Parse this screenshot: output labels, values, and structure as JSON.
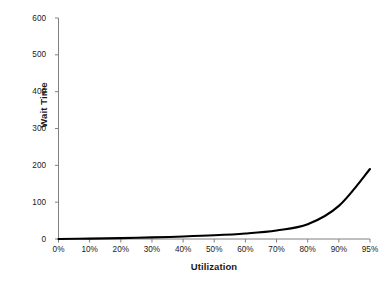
{
  "chart_data": {
    "type": "line",
    "title": "",
    "xlabel": "Utilization",
    "ylabel": "Wait Time",
    "categories": [
      "0%",
      "10%",
      "20%",
      "30%",
      "40%",
      "50%",
      "60%",
      "70%",
      "80%",
      "90%",
      "95%"
    ],
    "x_numeric": [
      0,
      10,
      20,
      30,
      40,
      50,
      60,
      70,
      80,
      90,
      95
    ],
    "values": [
      0,
      1.1,
      2.5,
      4.3,
      6.7,
      10,
      15,
      23.3,
      40,
      90,
      190
    ],
    "ylim": [
      0,
      600
    ],
    "yticks": [
      0,
      100,
      200,
      300,
      400,
      500,
      600
    ],
    "ytick_labels": [
      "0",
      "100",
      "200",
      "300",
      "400",
      "500",
      "600"
    ],
    "grid": false,
    "legend": false,
    "legend_position": "none",
    "series": [
      {
        "name": "Wait Time",
        "color": "#000000",
        "line_width": 2.1,
        "values": [
          0,
          1.1,
          2.5,
          4.3,
          6.7,
          10,
          15,
          23.3,
          40,
          90,
          190
        ]
      }
    ],
    "axis_color": "#808080",
    "text_color": "#1a1a1a",
    "background": "#ffffff"
  }
}
